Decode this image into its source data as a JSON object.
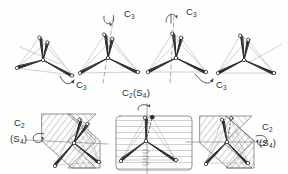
{
  "figure": {
    "background_color": "#fefefe",
    "ink_color": "#2b2b2b",
    "faint_ink_color": "#9a9a9a",
    "hatch_color": "#8d8d8d"
  },
  "labels": {
    "top_c3_left": "C",
    "top_c3_left_sub": "3",
    "top_c3_right": "C",
    "top_c3_right_sub": "3",
    "bottom_c3_left": "C",
    "bottom_c3_left_sub": "3",
    "bottom_c3_right": "C",
    "bottom_c3_right_sub": "3",
    "center_c2s4_main": "C",
    "center_c2s4_sub": "2",
    "center_c2s4_tail": "(S",
    "center_c2s4_tail_sub": "4",
    "center_c2s4_close": ")",
    "left_c2": "C",
    "left_c2_sub": "2",
    "left_s4": "(S",
    "left_s4_sub": "4",
    "left_s4_close": ")",
    "right_c2": "C",
    "right_c2_sub": "2",
    "right_s4": "(S",
    "right_s4_sub": "4",
    "right_s4_close": ")"
  },
  "molecules": {
    "top_row_count": 4,
    "bottom_row_count": 3,
    "geometry": "tetrahedral",
    "vertex_style": "open-circle",
    "bond_style": "tapered-wedge"
  },
  "operations": [
    {
      "name": "C3",
      "row": "top",
      "position": "left-axis"
    },
    {
      "name": "C3",
      "row": "top",
      "position": "right-axis"
    },
    {
      "name": "C3",
      "row": "top",
      "position": "lower-left-arrow"
    },
    {
      "name": "C3",
      "row": "top",
      "position": "lower-right-arrow"
    },
    {
      "name": "C2(S4)",
      "row": "bottom",
      "position": "center-vertical-axis"
    },
    {
      "name": "C2 (S4)",
      "row": "bottom",
      "position": "left-horizontal-axis"
    },
    {
      "name": "C2 (S4)",
      "row": "bottom",
      "position": "right-horizontal-axis"
    }
  ]
}
